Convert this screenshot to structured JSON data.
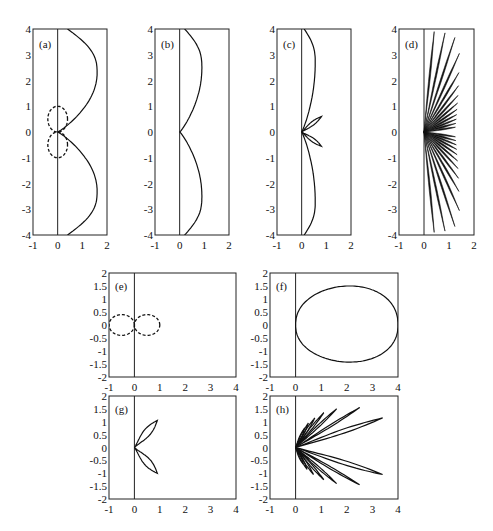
{
  "chart_data": [
    {
      "id": "a",
      "label": "(a)",
      "type": "line",
      "xlim": [
        -1,
        2
      ],
      "ylim": [
        -4,
        4
      ],
      "xticks": [
        "-1",
        "0",
        "1",
        "2"
      ],
      "yticks": [
        "4",
        "3",
        "2",
        "1",
        "0",
        "-1",
        "-2",
        "-3",
        "-4"
      ],
      "series": [
        {
          "name": "solid lobes",
          "style": "solid",
          "shape": "two large lobes touching origin, max x ~1.6 at y=±2.3, ends at (0.4, ±4)"
        },
        {
          "name": "dashed lobes",
          "style": "dashed",
          "shape": "two small lobes along y-axis, extent x ~[-0.4,0.4], y ~±1"
        }
      ],
      "grid": false
    },
    {
      "id": "b",
      "label": "(b)",
      "type": "line",
      "xlim": [
        -1,
        2
      ],
      "ylim": [
        -4,
        4
      ],
      "xticks": [
        "-1",
        "0",
        "1",
        "2"
      ],
      "yticks": [
        "4",
        "3",
        "2",
        "1",
        "0",
        "-1",
        "-2",
        "-3",
        "-4"
      ],
      "series": [
        {
          "name": "lobes",
          "style": "solid",
          "shape": "two lobes, max x ~0.9 at y=±2.5, ends at (0.2, ±4)"
        }
      ],
      "grid": false
    },
    {
      "id": "c",
      "label": "(c)",
      "type": "line",
      "xlim": [
        -1,
        2
      ],
      "ylim": [
        -4,
        4
      ],
      "xticks": [
        "-1",
        "0",
        "1",
        "2"
      ],
      "yticks": [
        "4",
        "3",
        "2",
        "1",
        "0",
        "-1",
        "-2",
        "-3",
        "-4"
      ],
      "series": [
        {
          "name": "main lobes",
          "style": "solid",
          "shape": "two lobes, max x ~0.55 at y=±2.7"
        },
        {
          "name": "side petals",
          "style": "solid",
          "shape": "two small petals, tips at (0.8, 0.6) and (0.8, -0.55)"
        }
      ],
      "grid": false
    },
    {
      "id": "d",
      "label": "(d)",
      "type": "line",
      "xlim": [
        -1,
        2
      ],
      "ylim": [
        -4,
        4
      ],
      "xticks": [
        "-1",
        "0",
        "1",
        "2"
      ],
      "yticks": [
        "4",
        "3",
        "2",
        "1",
        "0",
        "-1",
        "-2",
        "-3",
        "-4"
      ],
      "series": [
        {
          "name": "rays",
          "style": "solid",
          "shape": "fan of ~26 thin petals from origin, tips roughly on arc up to x~1.5, y up to ±4"
        }
      ],
      "grid": false
    },
    {
      "id": "e",
      "label": "(e)",
      "type": "line",
      "xlim": [
        -1,
        4
      ],
      "ylim": [
        -2,
        2
      ],
      "xticks": [
        "-1",
        "0",
        "1",
        "2",
        "3",
        "4"
      ],
      "yticks": [
        "2",
        "1.5",
        "1",
        "0.5",
        "0",
        "-0.5",
        "-1",
        "-1.5",
        "-2"
      ],
      "series": [
        {
          "name": "dashed figure-eight",
          "style": "dashed",
          "shape": "two lobes along x, extent x ~[-1,1], y ~±0.4"
        }
      ],
      "grid": false
    },
    {
      "id": "f",
      "label": "(f)",
      "type": "line",
      "xlim": [
        -1,
        4
      ],
      "ylim": [
        -2,
        2
      ],
      "xticks": [
        "-1",
        "0",
        "1",
        "2",
        "3",
        "4"
      ],
      "yticks": [
        "2",
        "1.5",
        "1",
        "0.5",
        "0",
        "-0.5",
        "-1",
        "-1.5",
        "-2"
      ],
      "series": [
        {
          "name": "teardrop",
          "style": "solid",
          "shape": "single lobe from origin to x=4, max |y| ~1.5 at x~2.4"
        }
      ],
      "grid": false
    },
    {
      "id": "g",
      "label": "(g)",
      "type": "line",
      "xlim": [
        -1,
        4
      ],
      "ylim": [
        -2,
        2
      ],
      "xticks": [
        "-1",
        "0",
        "1",
        "2",
        "3",
        "4"
      ],
      "yticks": [
        "2",
        "1.5",
        "1",
        "0.5",
        "0",
        "-0.5",
        "-1",
        "-1.5",
        "-2"
      ],
      "series": [
        {
          "name": "two petals",
          "style": "solid",
          "shape": "petal tips at (0.9, 1.05) and (0.9, -1.0)"
        }
      ],
      "grid": false
    },
    {
      "id": "h",
      "label": "(h)",
      "type": "line",
      "xlim": [
        -1,
        4
      ],
      "ylim": [
        -2,
        2
      ],
      "xticks": [
        "-1",
        "0",
        "1",
        "2",
        "3",
        "4"
      ],
      "yticks": [
        "2",
        "1.5",
        "1",
        "0.5",
        "0",
        "-0.5",
        "-1",
        "-1.5",
        "-2"
      ],
      "series": [
        {
          "name": "fan petals",
          "style": "solid",
          "shape": "many petals; longest tips at (3.4, 1.15) and (3.4, -1.05); others at (2.5,1.55),(1.6,1.5),(1.1,1.35),(2.5,-1.45),(1.6,-1.4),(1.1,-1.25)"
        }
      ],
      "grid": false
    }
  ]
}
